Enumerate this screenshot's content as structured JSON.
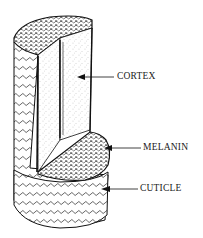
{
  "diagram": {
    "labels": [
      {
        "id": "cortex",
        "text": "CORTEX",
        "x": 117,
        "y": 71
      },
      {
        "id": "melanin",
        "text": "MELANIN",
        "x": 143,
        "y": 142
      },
      {
        "id": "cuticle",
        "text": "CUTICLE",
        "x": 140,
        "y": 183
      }
    ],
    "colors": {
      "ink": "#1a1a1a",
      "background": "#ffffff"
    }
  }
}
